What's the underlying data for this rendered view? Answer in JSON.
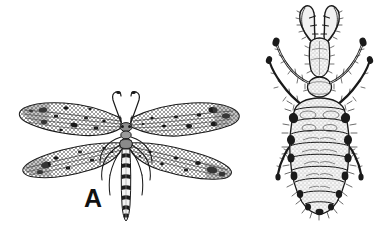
{
  "plate": {
    "kind": "scientific-line-illustration",
    "subject": "antlion (Neuroptera: Myrmeleontidae)",
    "background_color": "#ffffff",
    "ink_color": "#1a1a1a",
    "width": 381,
    "height": 230,
    "panel_count": 2
  },
  "panels": [
    {
      "label": "A",
      "name": "adult-antlion",
      "description": "winged adult shown dorsally with four long narrow mottled wings, slender segmented abdomen, short clubbed antennae and six legs",
      "features": {
        "wings": 4,
        "wing_texture": "dense cross-vein mesh with scattered dark spots",
        "antennae": 2,
        "antenna_shape": "short, clubbed",
        "legs": 6,
        "abdomen": "long, banded, segmented"
      }
    },
    {
      "label": "B",
      "name": "antlion-larva",
      "description": "larva shown dorsally with a pair of large curved toothed mandibles, broad hairy segmented abdomen and three pairs of legs",
      "features": {
        "mandibles": 2,
        "mandible_shape": "long, curved, sickle-like with inner teeth",
        "legs": 6,
        "body_segments": 9,
        "setae": "bristles along body margins"
      }
    }
  ],
  "labels": {
    "a": "A",
    "b": "B"
  }
}
